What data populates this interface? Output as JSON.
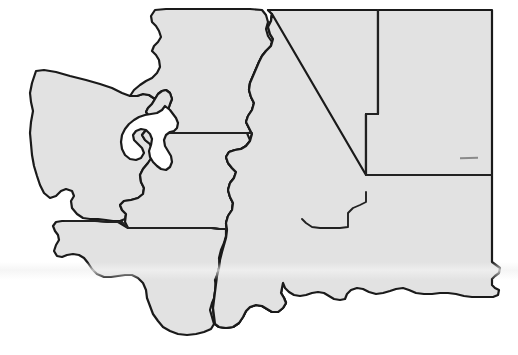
{
  "document": {
    "kind": "map",
    "title": "Washington State regional outline map",
    "subject": "Washington",
    "background_color": "#ffffff",
    "land_fill_color": "#e2e2e2",
    "water_fill_color": "#ffffff",
    "outline_color": "#1a1a1a",
    "internal_border_color": "#222222",
    "outline_width_px": 2.2,
    "internal_border_width_px": 1.9,
    "canvas": {
      "width": 518,
      "height": 355
    }
  },
  "map": {
    "name": "washington-regions",
    "region_count": 7,
    "regions": [
      {
        "id": "olympic-peninsula",
        "label": "Olympic Peninsula / Northwest Coast",
        "fill": "#e2e2e2",
        "path": "M 36,71 L 44,70 L 56,72 L 70,76 L 86,80 L 100,84 L 112,88 L 122,93 L 130,96 L 137,96 L 143,94 L 149,95 L 155,99 L 152,104 L 148,108 L 146,112 L 149,116 L 152,121 L 150,126 L 146,130 L 142,135 L 145,140 L 150,144 L 153,150 L 152,157 L 148,163 L 143,169 L 140,175 L 141,182 L 144,188 L 143,194 L 138,198 L 131,200 L 124,201 L 120,205 L 122,210 L 126,214 L 125,219 L 120,221 L 113,221 L 106,220 L 98,219 L 90,219 L 83,218 L 77,214 L 72,208 L 71,201 L 74,196 L 72,191 L 66,189 L 61,191 L 56,196 L 50,198 L 44,193 L 40,185 L 37,176 L 34,166 L 32,155 L 31,144 L 30,133 L 31,122 L 33,111 L 31,102 L 30,93 L 32,83 Z"
      },
      {
        "id": "northwest-puget",
        "label": "North Puget Sound",
        "fill": "#e2e2e2",
        "path": "M 155,10 L 166,9 L 180,9 L 200,9 L 225,9 L 250,9 L 262,10 L 266,15 L 268,22 L 266,29 L 268,36 L 272,42 L 270,49 L 267,55 L 269,61 L 272,67 L 270,74 L 268,80 L 270,87 L 273,93 L 271,100 L 268,106 L 269,113 L 272,119 L 271,126 L 268,132 L 247,133 L 232,133 L 215,133 L 198,133 L 182,133 L 170,133 L 170,127 L 172,121 L 171,115 L 168,110 L 170,104 L 172,99 L 170,93 L 166,90 L 162,91 L 158,94 L 155,99 L 149,95 L 143,94 L 137,96 L 130,96 L 134,90 L 140,85 L 146,81 L 152,78 L 157,73 L 160,67 L 159,60 L 156,55 L 152,51 L 154,46 L 158,42 L 161,37 L 159,31 L 156,26 L 152,22 L 151,16 Z"
      },
      {
        "id": "southwest-lowlands",
        "label": "Southwest Lowlands",
        "fill": "#e2e2e2",
        "path": "M 170,133 L 182,133 L 198,133 L 215,133 L 232,133 L 247,133 L 250,140 L 252,148 L 249,155 L 245,160 L 243,167 L 245,174 L 244,181 L 240,187 L 237,194 L 238,201 L 236,208 L 232,212 L 228,217 L 230,222 L 231,227 L 226,229 L 219,229 L 211,228 L 203,228 L 194,228 L 185,228 L 175,228 L 165,228 L 155,228 L 144,228 L 135,228 L 128,228 L 125,222 L 126,214 L 122,210 L 120,205 L 124,201 L 131,200 L 138,198 L 143,194 L 144,188 L 141,182 L 140,175 L 143,169 L 148,163 L 152,157 L 153,150 L 150,144 L 145,140 L 142,135 L 146,130 L 150,126 L 152,121 L 149,116 L 146,112 L 148,108 L 152,104 L 155,99 L 158,94 L 162,91 L 166,90 L 170,93 L 172,99 L 170,104 L 168,110 L 171,115 L 172,121 L 170,127 Z"
      },
      {
        "id": "south-coast",
        "label": "South Coast / Lower Columbia",
        "fill": "#e2e2e2",
        "path": "M 68,221 L 77,221 L 88,221 L 98,221 L 108,222 L 118,222 L 128,228 L 135,228 L 144,228 L 155,228 L 165,228 L 175,228 L 185,228 L 194,228 L 203,228 L 211,228 L 219,229 L 226,229 L 226,236 L 224,243 L 221,250 L 219,258 L 220,266 L 218,273 L 215,280 L 216,288 L 215,296 L 212,303 L 210,310 L 212,317 L 214,324 L 211,329 L 204,332 L 196,334 L 187,335 L 178,334 L 170,331 L 163,327 L 158,321 L 153,314 L 150,306 L 147,298 L 146,290 L 143,283 L 138,278 L 132,275 L 125,275 L 118,276 L 111,277 L 104,277 L 97,274 L 92,269 L 88,263 L 84,258 L 79,255 L 73,254 L 67,255 L 62,257 L 57,256 L 54,251 L 56,245 L 59,240 L 58,235 L 55,231 L 53,226 L 56,222 L 62,221 Z"
      },
      {
        "id": "central-cascades",
        "label": "Central Cascades",
        "fill": "#e2e2e2",
        "path": "M 268,10 L 272,14 L 271,21 L 268,27 L 270,34 L 273,39 L 271,46 L 266,51 L 262,56 L 259,62 L 256,69 L 253,76 L 250,83 L 249,90 L 251,97 L 254,103 L 252,110 L 248,116 L 246,122 L 249,128 L 252,134 L 250,141 L 246,146 L 241,149 L 235,150 L 229,152 L 226,157 L 228,163 L 232,168 L 236,172 L 234,178 L 230,183 L 228,190 L 230,197 L 233,203 L 232,210 L 228,216 L 226,223 L 227,230 L 226,238 L 224,245 L 222,252 L 220,260 L 219,268 L 217,276 L 216,284 L 215,292 L 214,300 L 213,308 L 214,316 L 215,324 L 219,327 L 226,328 L 233,327 L 239,323 L 243,317 L 246,311 L 250,307 L 256,305 L 262,306 L 267,309 L 272,312 L 278,312 L 283,308 L 286,303 L 284,298 L 281,293 L 282,287 L 286,283 L 291,281 L 296,279 L 300,275 L 301,269 L 299,263 L 297,257 L 299,251 L 302,246 L 301,240 L 298,235 L 296,229 L 298,223 L 302,219 L 306,215 L 305,209 L 302,204 L 300,198 L 302,192 L 306,188 L 311,185 L 316,182 L 318,176 L 316,170 L 313,165 L 311,159 L 313,153 L 317,149 L 322,146 L 327,143 L 329,137 L 327,131 L 324,126 L 321,121 L 319,115 L 320,108 L 318,102 L 314,98 L 309,96 L 303,96 L 297,95 L 292,92 L 288,87 L 285,81 L 283,75 L 280,69 L 277,63 L 275,57 L 276,50 L 279,45 L 283,41 L 286,36 L 285,30 L 282,25 L 280,19 L 281,13 L 284,10 Z"
      },
      {
        "id": "columbia-basin",
        "label": "Columbia Basin / Central Plateau",
        "fill": "#e2e2e2",
        "path": "M 284,10 L 300,10 L 320,10 L 340,10 L 360,10 L 378,10 L 378,18 L 378,30 L 378,45 L 378,60 L 378,75 L 378,90 L 378,102 L 378,114 L 372,114 L 366,114 L 366,122 L 366,132 L 366,145 L 366,158 L 366,170 L 366,182 L 366,192 L 366,202 L 360,205 L 353,208 L 348,213 L 348,219 L 348,226 L 341,228 L 334,228 L 327,228 L 320,228 L 313,227 L 307,223 L 302,219 L 298,223 L 296,229 L 298,235 L 301,240 L 302,246 L 299,251 L 297,257 L 299,263 L 301,269 L 300,275 L 296,279 L 291,281 L 286,283 L 282,287 L 281,293 L 284,298 L 286,303 L 283,308 L 278,312 L 272,312 L 267,309 L 262,306 L 256,305 L 250,307 L 246,311 L 243,317 L 239,323 L 233,327 L 226,328 L 219,327 L 215,324 L 214,316 L 213,308 L 214,300 L 215,292 L 216,284 L 217,276 L 219,268 L 220,260 L 222,252 L 224,245 L 226,238 L 227,230 L 226,223 L 228,216 L 232,210 L 233,203 L 230,197 L 228,190 L 230,183 L 234,178 L 236,172 L 232,168 L 228,163 L 226,157 L 229,152 L 235,150 L 241,149 L 246,146 L 250,141 L 252,134 L 249,128 L 246,122 L 248,116 L 252,110 L 254,103 L 251,97 L 249,90 L 250,83 L 253,76 L 256,69 L 259,62 L 262,56 L 266,51 L 271,46 L 273,39 L 270,34 L 268,27 L 271,21 L 272,14 L 268,10 Z"
      },
      {
        "id": "northeast",
        "label": "Northeast Washington",
        "fill": "#e2e2e2",
        "path": "M 378,10 L 400,10 L 425,10 L 450,10 L 475,10 L 492,10 L 492,25 L 492,45 L 492,65 L 492,85 L 492,105 L 492,120 L 492,135 L 492,150 L 492,162 L 492,175 L 480,175 L 465,175 L 450,175 L 435,175 L 420,175 L 405,175 L 390,175 L 378,175 L 370,175 L 366,175 L 366,162 L 366,148 L 366,134 L 366,122 L 366,114 L 372,114 L 378,114 L 378,102 L 378,90 L 378,75 L 378,60 L 378,45 L 378,30 L 378,18 Z"
      },
      {
        "id": "southeast",
        "label": "Southeast Washington / Palouse",
        "fill": "#e2e2e2",
        "path": "M 366,175 L 378,175 L 390,175 L 405,175 L 420,175 L 435,175 L 450,175 L 465,175 L 480,175 L 492,175 L 492,190 L 492,205 L 492,220 L 492,235 L 492,248 L 492,262 L 496,265 L 500,268 L 499,273 L 495,276 L 492,279 L 492,285 L 495,288 L 499,290 L 498,295 L 493,297 L 487,297 L 480,297 L 472,297 L 464,296 L 456,294 L 448,293 L 440,293 L 432,294 L 424,294 L 416,293 L 409,290 L 403,288 L 396,289 L 390,291 L 383,293 L 376,294 L 369,292 L 363,289 L 357,288 L 351,290 L 347,294 L 345,299 L 340,300 L 334,299 L 329,296 L 324,293 L 318,292 L 312,293 L 306,295 L 300,296 L 294,295 L 289,292 L 285,288 L 283,283 L 281,293 L 284,298 L 286,303 L 283,308 L 278,312 L 272,312 L 267,309 L 262,306 L 256,305 L 250,307 L 246,311 L 243,317 L 239,323 L 233,327 L 226,328 L 219,327 L 215,324 L 214,316 L 213,308 L 214,300 L 215,292 L 216,284 L 217,276 L 219,268 L 220,260 L 222,252 L 224,245 L 226,238 L 227,230 L 226,223 L 228,216 L 232,210 L 233,203 L 230,197 L 228,190 L 230,183 L 234,178 L 236,172 L 232,168 L 228,163 L 226,157 L 229,152 L 235,150 L 241,149 L 246,146 L 250,141 L 252,134 L 249,128 L 246,122 L 248,116 L 252,110 L 254,103 L 251,97 L 249,90 L 250,83 L 253,76 L 256,69 L 259,62 L 262,56 L 266,51 L 271,46 L 273,39 L 270,34 L 268,27 L 271,21 L 272,14 Z"
      }
    ],
    "water_bodies": [
      {
        "id": "puget-sound",
        "label": "Puget Sound",
        "fill": "#ffffff",
        "path": "M 165,106 L 162,110 L 157,113 L 151,114 L 145,115 L 139,117 L 134,120 L 129,124 L 125,129 L 122,135 L 121,142 L 122,149 L 125,155 L 130,159 L 136,160 L 141,158 L 144,153 L 142,148 L 138,144 L 134,140 L 133,135 L 136,131 L 141,129 L 146,130 L 150,134 L 152,139 L 151,145 L 149,151 L 150,157 L 153,162 L 157,166 L 161,169 L 166,170 L 170,167 L 172,162 L 171,156 L 168,151 L 165,146 L 164,140 L 166,135 L 170,132 L 174,131 L 177,128 L 178,123 L 176,118 L 173,114 L 170,110 Z"
      }
    ],
    "internal_borders": [
      {
        "id": "border-north-puget-southwest",
        "label": "North Puget / Southwest Lowlands boundary",
        "path": "M 170,133 L 182,133 L 200,133 L 220,133 L 240,133 L 252,133"
      },
      {
        "id": "border-olympic-south-coast",
        "label": "Olympic / South Coast boundary",
        "path": "M 65,221 L 80,221 L 95,221 L 110,222 L 122,222"
      },
      {
        "id": "border-southwest-south-coast",
        "label": "Southwest Lowlands / South Coast boundary",
        "path": "M 122,222 L 128,228 L 140,228 L 155,228 L 170,228 L 185,228 L 200,228 L 212,228 L 220,229 L 227,229"
      },
      {
        "id": "border-northeast-columbia",
        "label": "Northeast / Columbia Basin boundary",
        "path": "M 378,10 L 378,30 L 378,55 L 378,80 L 378,102 L 378,114 L 370,114 L 366,114 L 366,130 L 366,150 L 366,165 L 366,175"
      },
      {
        "id": "border-northeast-southeast",
        "label": "Northeast / Southeast boundary",
        "path": "M 366,175 L 390,175 L 420,175 L 450,175 L 475,175 L 492,175"
      },
      {
        "id": "border-columbia-southeast",
        "label": "Columbia Basin / Southeast boundary",
        "path": "M 366,192 L 366,202 L 360,205 L 353,208 L 348,213 L 348,220 L 348,227 L 340,228 L 330,228 L 320,228 L 312,227 L 306,223 L 302,219"
      }
    ],
    "artifacts": [
      {
        "id": "scan-dash",
        "label": "scanner dash artifact",
        "x": 460,
        "y": 157,
        "width": 18,
        "height": 2,
        "color": "#8a8a8a"
      },
      {
        "id": "scan-band",
        "label": "horizontal scan band",
        "y": 262,
        "height": 18,
        "color": "#f2f2f2"
      }
    ]
  },
  "chart_data": {
    "type": "map",
    "region_names": [
      "Olympic Peninsula / Northwest Coast",
      "North Puget Sound",
      "Southwest Lowlands",
      "South Coast / Lower Columbia",
      "Central Cascades",
      "Columbia Basin / Central Plateau",
      "Northeast Washington",
      "Southeast Washington / Palouse"
    ],
    "legend": [],
    "annotations": [],
    "grid": false
  }
}
